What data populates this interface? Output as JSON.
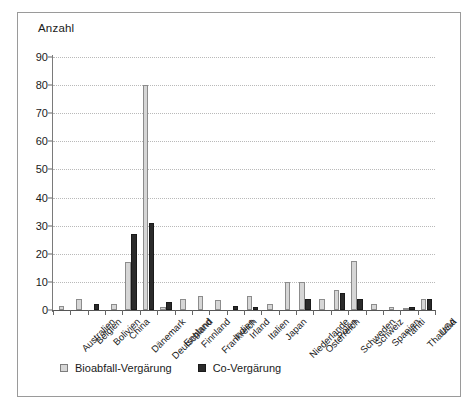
{
  "chart_data": {
    "type": "bar",
    "title": "",
    "subtitle": "",
    "xlabel": "",
    "ylabel": "Anzahl",
    "ylim": [
      0,
      90
    ],
    "ytick_step": 10,
    "yticks": [
      0,
      10,
      20,
      30,
      40,
      50,
      60,
      70,
      80,
      90
    ],
    "grid": true,
    "grid_axis": "y",
    "legend_position": "bottom-left",
    "categories": [
      "Australien",
      "Belgien",
      "Bolivien",
      "China",
      "Dänemark",
      "Deutschland",
      "England",
      "Finnland",
      "Frankreich",
      "Indien",
      "Irland",
      "Italien",
      "Japan",
      "Niederlande",
      "Österreich",
      "Polen",
      "Schweden",
      "Schweiz",
      "Spanien",
      "Tahiti",
      "Thailand",
      "USA"
    ],
    "series": [
      {
        "name": "Bioabfall-Vergärung",
        "color": "#d6d6d6",
        "values": [
          1.5,
          4,
          0,
          2,
          17,
          80,
          1,
          4,
          5,
          3.5,
          0,
          5,
          2,
          10,
          10,
          4,
          7,
          17.5,
          2,
          1,
          0.8,
          4
        ]
      },
      {
        "name": "Co-Vergärung",
        "color": "#2b2b2b",
        "values": [
          0,
          0,
          2,
          0,
          27,
          31,
          3,
          0,
          0,
          0,
          1.5,
          1,
          0,
          0,
          4,
          0,
          6,
          4,
          0,
          0,
          1,
          4
        ]
      }
    ]
  },
  "legend": {
    "items": [
      {
        "label": "Bioabfall-Vergärung",
        "marker": "light-square-icon"
      },
      {
        "label": "Co-Vergärung",
        "marker": "dark-square-icon"
      }
    ]
  },
  "colors": {
    "series_light": "#d6d6d6",
    "series_dark": "#2b2b2b",
    "gridline": "#b9b9b9",
    "axis": "#555555",
    "frame": "#9a9a9a",
    "text": "#1a1a1a",
    "background": "#ffffff"
  }
}
